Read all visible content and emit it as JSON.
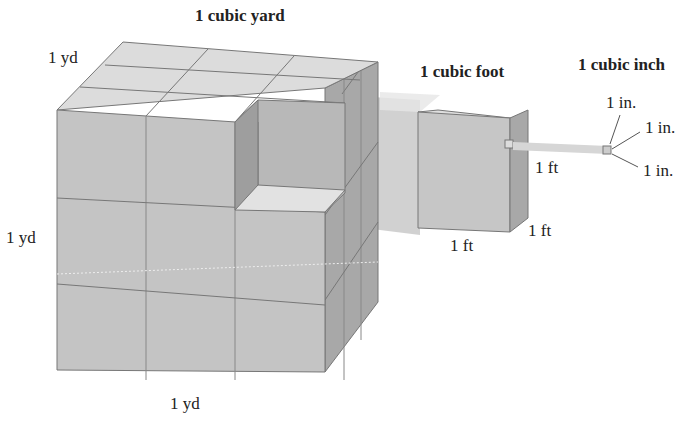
{
  "titles": {
    "yard": "1 cubic yard",
    "foot": "1 cubic foot",
    "inch": "1 cubic inch"
  },
  "labels": {
    "yard_depth": "1 yd",
    "yard_height": "1 yd",
    "yard_width": "1 yd",
    "foot_height": "1 ft",
    "foot_depth": "1 ft",
    "foot_width": "1 ft",
    "inch_a": "1 in.",
    "inch_b": "1 in.",
    "inch_c": "1 in."
  },
  "colors": {
    "front_face": "#c4c4c4",
    "top_face": "#dedede",
    "side_face": "#a9a9a9",
    "edge": "#777777",
    "beam": "#d8d8d8"
  }
}
